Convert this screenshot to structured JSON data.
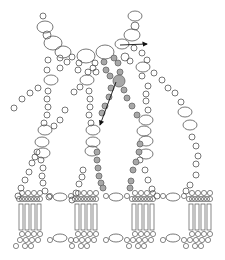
{
  "diagram": {
    "colors": {
      "background": "#ffffff",
      "stroke": "#555555",
      "highlight_fill": "#a8a8a8",
      "arrow": "#111111"
    },
    "open_beads": [
      [
        43,
        16,
        3
      ],
      [
        45,
        27,
        7
      ],
      [
        47,
        35,
        4
      ],
      [
        53,
        43,
        8
      ],
      [
        63,
        52,
        7
      ],
      [
        72,
        57,
        3
      ],
      [
        86,
        56,
        8
      ],
      [
        105,
        52,
        8
      ],
      [
        135,
        16,
        6
      ],
      [
        135,
        26,
        4
      ],
      [
        132,
        35,
        7
      ],
      [
        122,
        44,
        6
      ],
      [
        134,
        48,
        3
      ],
      [
        142,
        53,
        3
      ],
      [
        125,
        57,
        4
      ],
      [
        130,
        61,
        3
      ],
      [
        48,
        60,
        3
      ],
      [
        60,
        58,
        3
      ],
      [
        67,
        62,
        3
      ],
      [
        47,
        70,
        3
      ],
      [
        60,
        68,
        3
      ],
      [
        79,
        63,
        3
      ],
      [
        78,
        70,
        3
      ],
      [
        95,
        63,
        3
      ],
      [
        93,
        68,
        3
      ],
      [
        51,
        80,
        6
      ],
      [
        87,
        80,
        6
      ],
      [
        88,
        72,
        3
      ],
      [
        96,
        72,
        3
      ],
      [
        143,
        67,
        6
      ],
      [
        147,
        60,
        3
      ],
      [
        142,
        76,
        3
      ],
      [
        154,
        73,
        3
      ],
      [
        162,
        80,
        3
      ],
      [
        168,
        88,
        3
      ],
      [
        175,
        93,
        3
      ],
      [
        181,
        102,
        3
      ],
      [
        148,
        86,
        3
      ],
      [
        146,
        94,
        3
      ],
      [
        146,
        101,
        3
      ],
      [
        148,
        110,
        3
      ],
      [
        38,
        88,
        3
      ],
      [
        30,
        93,
        3
      ],
      [
        22,
        99,
        3
      ],
      [
        14,
        108,
        3
      ],
      [
        74,
        92,
        3
      ],
      [
        80,
        87,
        3
      ],
      [
        65,
        110,
        3
      ],
      [
        60,
        120,
        3
      ],
      [
        54,
        126,
        3
      ],
      [
        48,
        91,
        3
      ],
      [
        47,
        99,
        3
      ],
      [
        48,
        107,
        3
      ],
      [
        47,
        115,
        3
      ],
      [
        44,
        123,
        3
      ],
      [
        89,
        91,
        3
      ],
      [
        90,
        99,
        3
      ],
      [
        90,
        107,
        3
      ],
      [
        89,
        115,
        3
      ],
      [
        91,
        123,
        3
      ],
      [
        146,
        120,
        6
      ],
      [
        185,
        112,
        6
      ],
      [
        190,
        125,
        6
      ],
      [
        192,
        137,
        3
      ],
      [
        196,
        146,
        3
      ],
      [
        198,
        156,
        3
      ],
      [
        196,
        164,
        3
      ],
      [
        196,
        175,
        3
      ],
      [
        45,
        130,
        6
      ],
      [
        42,
        142,
        6
      ],
      [
        43,
        153,
        6
      ],
      [
        93,
        130,
        6
      ],
      [
        93,
        142,
        6
      ],
      [
        92,
        151,
        6
      ],
      [
        144,
        131,
        6
      ],
      [
        146,
        141,
        6
      ],
      [
        146,
        154,
        6
      ],
      [
        37,
        152,
        3
      ],
      [
        35,
        157,
        3
      ],
      [
        32,
        163,
        3
      ],
      [
        29,
        172,
        3
      ],
      [
        25,
        180,
        3
      ],
      [
        21,
        188,
        3
      ],
      [
        18,
        196,
        3
      ],
      [
        41,
        160,
        3
      ],
      [
        43,
        168,
        3
      ],
      [
        42,
        176,
        3
      ],
      [
        43,
        183,
        3
      ],
      [
        45,
        191,
        3
      ],
      [
        49,
        197,
        3
      ],
      [
        83,
        170,
        3
      ],
      [
        82,
        177,
        3
      ],
      [
        79,
        184,
        3
      ],
      [
        76,
        193,
        3
      ],
      [
        72,
        200,
        3
      ],
      [
        140,
        160,
        3
      ],
      [
        145,
        170,
        3
      ],
      [
        148,
        180,
        3
      ],
      [
        152,
        189,
        3
      ],
      [
        157,
        196,
        3
      ],
      [
        190,
        185,
        3
      ],
      [
        186,
        191,
        3
      ]
    ],
    "filled_beads": [
      [
        104,
        62,
        3
      ],
      [
        114,
        58,
        3
      ],
      [
        106,
        70,
        3
      ],
      [
        118,
        63,
        3
      ],
      [
        110,
        76,
        3
      ],
      [
        120,
        72,
        3
      ],
      [
        119,
        81,
        6
      ],
      [
        111,
        88,
        3
      ],
      [
        124,
        90,
        3
      ],
      [
        109,
        97,
        3
      ],
      [
        127,
        98,
        3
      ],
      [
        105,
        106,
        3
      ],
      [
        132,
        106,
        3
      ],
      [
        102,
        113,
        3
      ],
      [
        137,
        115,
        3
      ],
      [
        97,
        152,
        3
      ],
      [
        97,
        160,
        3
      ],
      [
        98,
        168,
        3
      ],
      [
        99,
        176,
        3
      ],
      [
        101,
        183,
        3
      ],
      [
        103,
        188,
        3
      ],
      [
        140,
        144,
        3
      ],
      [
        139,
        152,
        3
      ],
      [
        136,
        162,
        3
      ],
      [
        133,
        170,
        3
      ],
      [
        131,
        181,
        3
      ],
      [
        130,
        188,
        3
      ]
    ],
    "units_x": [
      22,
      78,
      135,
      192
    ],
    "arrow_right": {
      "x1": 120,
      "y1": 45,
      "x2": 147,
      "y2": 44
    },
    "arrow_down": {
      "x1": 116,
      "y1": 82,
      "x2": 100,
      "y2": 125
    }
  }
}
